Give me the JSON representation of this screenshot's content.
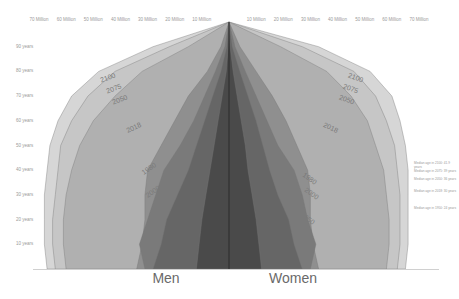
{
  "chart_data": {
    "type": "area",
    "title": "",
    "subtitle": "",
    "xlabel_left": "Men",
    "xlabel_right": "Women",
    "ylabel": "Age",
    "x_ticks_left": [
      "70 Million",
      "60 Million",
      "50 Million",
      "40 Million",
      "30 Million",
      "20 Million",
      "10 Million"
    ],
    "x_ticks_right": [
      "10 Million",
      "20 Million",
      "30 Million",
      "40 Million",
      "50 Million",
      "60 Million",
      "70 Million"
    ],
    "y_ticks": [
      "90 years",
      "80 years",
      "70 years",
      "60 years",
      "50 years",
      "40 years",
      "30 years",
      "20 years",
      "10 years"
    ],
    "xlim": [
      -75,
      75
    ],
    "ylim": [
      0,
      100
    ],
    "grid": false,
    "legend_position": "inline labels on curves",
    "series": [
      {
        "name": "1950",
        "color": "#4a4a4a",
        "ages": [
          0,
          10,
          20,
          30,
          40,
          50,
          60,
          70,
          80,
          90,
          100
        ],
        "men": [
          12,
          11,
          10,
          8.5,
          7,
          5.5,
          4,
          2.5,
          1,
          0.3,
          0
        ],
        "women": [
          12,
          11,
          10,
          8.5,
          7,
          6,
          4.5,
          3,
          1.5,
          0.4,
          0
        ]
      },
      {
        "name": "1980",
        "color": "#666666",
        "ages": [
          0,
          10,
          20,
          30,
          40,
          50,
          60,
          70,
          80,
          90,
          100
        ],
        "men": [
          28,
          25,
          23,
          19,
          15,
          12,
          9,
          6,
          3,
          0.8,
          0
        ],
        "women": [
          27,
          24,
          22,
          18,
          15,
          12.5,
          10,
          7,
          4,
          1.2,
          0
        ]
      },
      {
        "name": "2000",
        "color": "#7a7a7a",
        "ages": [
          0,
          10,
          20,
          30,
          40,
          50,
          60,
          70,
          80,
          90,
          100
        ],
        "men": [
          31,
          33,
          30,
          27,
          24,
          18,
          13,
          9,
          5,
          1.5,
          0
        ],
        "women": [
          30,
          32,
          29,
          27,
          24,
          18,
          14,
          10,
          6,
          2.2,
          0
        ]
      },
      {
        "name": "2018",
        "color": "#8f8f8f",
        "ages": [
          0,
          10,
          20,
          30,
          40,
          50,
          60,
          70,
          80,
          90,
          100
        ],
        "men": [
          34,
          32,
          31,
          31,
          30,
          25,
          20,
          15,
          8,
          3,
          0
        ],
        "women": [
          33,
          31,
          30,
          30,
          29,
          25,
          21,
          16,
          10,
          4,
          0
        ]
      },
      {
        "name": "2050",
        "color": "#b0b0b0",
        "ages": [
          0,
          10,
          20,
          30,
          40,
          50,
          60,
          70,
          80,
          90,
          100
        ],
        "men": [
          60,
          61,
          61,
          60,
          58,
          55,
          50,
          42,
          32,
          15,
          0
        ],
        "women": [
          58,
          59,
          59,
          58,
          57,
          54,
          51,
          45,
          36,
          19,
          0
        ]
      },
      {
        "name": "2075",
        "color": "#c6c6c6",
        "ages": [
          0,
          10,
          20,
          30,
          40,
          50,
          60,
          70,
          80,
          90,
          100
        ],
        "men": [
          64,
          65,
          65,
          64,
          63,
          62,
          58,
          52,
          42,
          22,
          0
        ],
        "women": [
          62,
          63,
          63,
          63,
          62,
          61,
          58,
          54,
          46,
          27,
          0
        ]
      },
      {
        "name": "2100",
        "color": "#d6d6d6",
        "ages": [
          0,
          10,
          20,
          30,
          40,
          50,
          60,
          70,
          80,
          90,
          100
        ],
        "men": [
          67,
          68,
          68,
          68,
          67,
          66,
          63,
          58,
          48,
          28,
          0
        ],
        "women": [
          65,
          66,
          66,
          66,
          66,
          65,
          63,
          60,
          52,
          33,
          0
        ]
      }
    ],
    "annotations": [
      "Median age in 2100: 41.9 years",
      "Median age in 2075: 39 years",
      "Median age in 2050: 36 years",
      "Median age in 2018: 30 years",
      "Median age in 1950: 24 years"
    ]
  }
}
